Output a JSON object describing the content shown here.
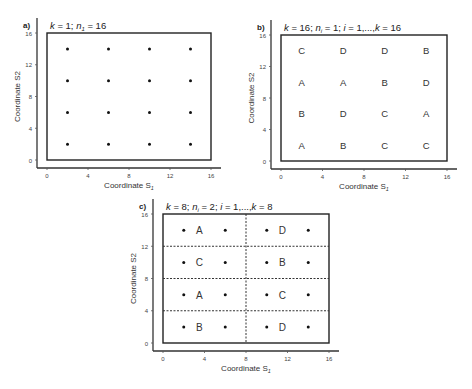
{
  "panels": [
    {
      "id": "a",
      "label": "a)",
      "title": "k = 1; n1 = 16",
      "title_parts": {
        "k": "k",
        "eq1": " = 1; ",
        "n": "n",
        "sub": "1",
        "eq2": " = 16"
      },
      "xlabel": "Coordinate S",
      "xlabel_sub": "1",
      "ylabel": "Coordinate S2",
      "ticks": [
        "0",
        "4",
        "8",
        "12",
        "16"
      ],
      "points": [
        [
          2,
          2
        ],
        [
          6,
          2
        ],
        [
          10,
          2
        ],
        [
          14,
          2
        ],
        [
          2,
          6
        ],
        [
          6,
          6
        ],
        [
          10,
          6
        ],
        [
          14,
          6
        ],
        [
          2,
          10
        ],
        [
          6,
          10
        ],
        [
          10,
          10
        ],
        [
          14,
          10
        ],
        [
          2,
          14
        ],
        [
          6,
          14
        ],
        [
          10,
          14
        ],
        [
          14,
          14
        ]
      ]
    },
    {
      "id": "b",
      "label": "b)",
      "title_parts": {
        "k": "k",
        "eq1": " = 16; ",
        "n": "n",
        "sub": "i",
        "eq2": " = 1; ",
        "i": "i",
        "eq3": " = 1,...,",
        "k2": "k",
        "eq4": " = 16"
      },
      "xlabel": "Coordinate S",
      "xlabel_sub": "1",
      "ylabel": "Coordinate S2",
      "ticks": [
        "0",
        "4",
        "8",
        "12",
        "16"
      ],
      "cells": [
        {
          "x": 2,
          "y": 14,
          "t": "C"
        },
        {
          "x": 6,
          "y": 14,
          "t": "D"
        },
        {
          "x": 10,
          "y": 14,
          "t": "D"
        },
        {
          "x": 14,
          "y": 14,
          "t": "B"
        },
        {
          "x": 2,
          "y": 10,
          "t": "A"
        },
        {
          "x": 6,
          "y": 10,
          "t": "A"
        },
        {
          "x": 10,
          "y": 10,
          "t": "B"
        },
        {
          "x": 14,
          "y": 10,
          "t": "D"
        },
        {
          "x": 2,
          "y": 6,
          "t": "B"
        },
        {
          "x": 6,
          "y": 6,
          "t": "D"
        },
        {
          "x": 10,
          "y": 6,
          "t": "C"
        },
        {
          "x": 14,
          "y": 6,
          "t": "A"
        },
        {
          "x": 2,
          "y": 2,
          "t": "A"
        },
        {
          "x": 6,
          "y": 2,
          "t": "B"
        },
        {
          "x": 10,
          "y": 2,
          "t": "C"
        },
        {
          "x": 14,
          "y": 2,
          "t": "C"
        }
      ]
    },
    {
      "id": "c",
      "label": "c)",
      "title_parts": {
        "k": "k",
        "eq1": " = 8; ",
        "n": "n",
        "sub": "i",
        "eq2": " = 2; ",
        "i": "i",
        "eq3": " = 1,...,",
        "k2": "k",
        "eq4": " = 8"
      },
      "xlabel": "Coordinate S",
      "xlabel_sub": "1",
      "ylabel": "Coordinate S2",
      "ticks": [
        "0",
        "4",
        "8",
        "12",
        "16"
      ],
      "points": [
        [
          2,
          2
        ],
        [
          6,
          2
        ],
        [
          10,
          2
        ],
        [
          14,
          2
        ],
        [
          2,
          6
        ],
        [
          6,
          6
        ],
        [
          10,
          6
        ],
        [
          14,
          6
        ],
        [
          2,
          10
        ],
        [
          6,
          10
        ],
        [
          10,
          10
        ],
        [
          14,
          10
        ],
        [
          2,
          14
        ],
        [
          6,
          14
        ],
        [
          10,
          14
        ],
        [
          14,
          14
        ]
      ],
      "blocks": [
        {
          "x": 3.5,
          "y": 14,
          "t": "A"
        },
        {
          "x": 11.5,
          "y": 14,
          "t": "D"
        },
        {
          "x": 3.5,
          "y": 10,
          "t": "C"
        },
        {
          "x": 11.5,
          "y": 10,
          "t": "B"
        },
        {
          "x": 3.5,
          "y": 6,
          "t": "A"
        },
        {
          "x": 11.5,
          "y": 6,
          "t": "C"
        },
        {
          "x": 3.5,
          "y": 2,
          "t": "B"
        },
        {
          "x": 11.5,
          "y": 2,
          "t": "D"
        }
      ]
    }
  ]
}
